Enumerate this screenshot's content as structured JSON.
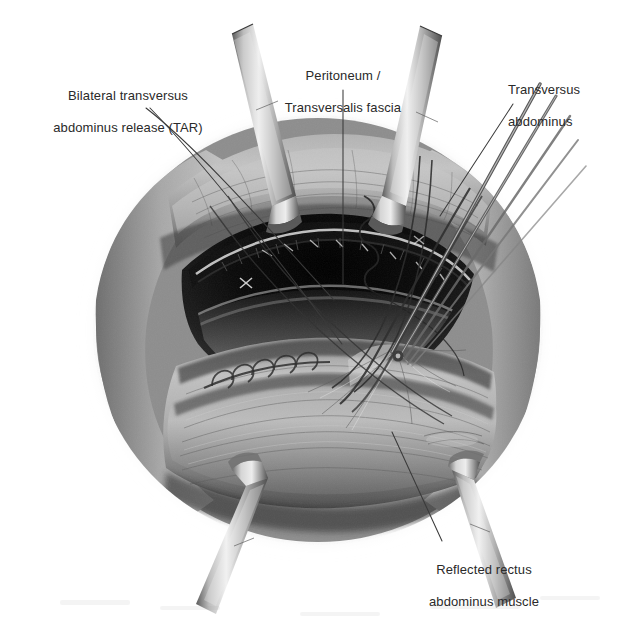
{
  "figure": {
    "kind": "medical-illustration",
    "modality": "grayscale pencil rendering",
    "background_color": "#ffffff",
    "ink_color": "#2a2a2a"
  },
  "annotations": [
    {
      "id": "tar",
      "text": "Bilateral transversus\nabdominus release (TAR)",
      "align": "center",
      "leaders": 2
    },
    {
      "id": "peritoneum",
      "text": "Peritoneum /\nTransversalis fascia",
      "align": "center",
      "leaders": 1
    },
    {
      "id": "transversus",
      "text": "Transversus\nabdominus",
      "align": "left",
      "leaders": 1
    },
    {
      "id": "rectus",
      "text": "Reflected rectus\nabdominus muscle",
      "align": "center",
      "leaders": 1
    }
  ],
  "labels": {
    "tar_line1": "Bilateral transversus",
    "tar_line2": "abdominus release (TAR)",
    "peritoneum_line1": "Peritoneum /",
    "peritoneum_line2": "Transversalis fascia",
    "transversus_line1": "Transversus",
    "transversus_line2": "abdominus",
    "rectus_line1": "Reflected rectus",
    "rectus_line2": "abdominus muscle"
  },
  "palette": {
    "paper": "#ffffff",
    "vignette_edge": "#b9b9b9",
    "skin_mid": "#9a9a9a",
    "skin_light": "#cfcfcf",
    "skin_dark": "#6e6e6e",
    "cavity_black": "#0d0d0d",
    "cavity_deep": "#1a1a1a",
    "muscle_gray": "#8b8b8b",
    "instrument_light": "#e2e2e2",
    "instrument_mid": "#9d9d9d",
    "instrument_dark": "#4a4a4a",
    "suture": "#3c3c3c",
    "leader_line": "#3a3a3a"
  },
  "instruments": [
    {
      "name": "retractor-blade-top-left",
      "position": "upper-left",
      "angle_deg": -20
    },
    {
      "name": "retractor-blade-top-right",
      "position": "upper-right",
      "angle_deg": 20
    },
    {
      "name": "retractor-blade-bottom-left",
      "position": "lower-left",
      "angle_deg": 20
    },
    {
      "name": "retractor-blade-bottom-right",
      "position": "lower-right",
      "angle_deg": -20
    },
    {
      "name": "forceps-upper-right",
      "position": "right",
      "angle_deg": 55
    },
    {
      "name": "needle-driver",
      "position": "center-right",
      "angle_deg": 55
    }
  ],
  "anatomy": [
    {
      "name": "abdominal-wall-superior",
      "region": "top"
    },
    {
      "name": "peritoneal-cavity",
      "region": "center"
    },
    {
      "name": "transversus-abdominis-edge",
      "region": "center-right"
    },
    {
      "name": "reflected-rectus-muscle",
      "region": "bottom"
    },
    {
      "name": "suture-row",
      "region": "center-left"
    },
    {
      "name": "running-suture",
      "region": "center"
    }
  ]
}
